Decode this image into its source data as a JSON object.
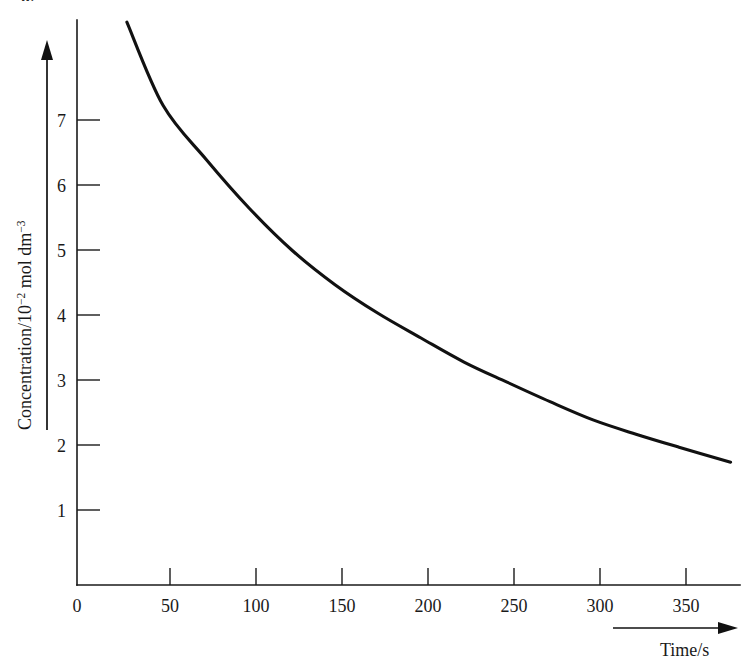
{
  "page": {
    "folio": "62"
  },
  "figure": {
    "name": "concentration-time-decay-plot"
  },
  "chart_data": {
    "type": "line",
    "title": "",
    "subtitle": "",
    "xlabel": "Time/s",
    "ylabel_text": "Concentration/10",
    "ylabel_sup1": "−2",
    "ylabel_mid": " mol dm",
    "ylabel_sup2": "−3",
    "ylabel_full": "Concentration/10−2 mol dm−3",
    "xlim": [
      0,
      390
    ],
    "ylim": [
      0,
      8.7
    ],
    "xticks": [
      0,
      50,
      100,
      150,
      200,
      250,
      300,
      350
    ],
    "xticklabels": [
      "0",
      "50",
      "100",
      "150",
      "200",
      "250",
      "300",
      "350"
    ],
    "yticks": [
      1,
      2,
      3,
      4,
      5,
      6,
      7
    ],
    "yticklabels": [
      "1",
      "2",
      "3",
      "4",
      "5",
      "6",
      "7"
    ],
    "grid": false,
    "legend": null,
    "legend_position": "none",
    "axis_arrows": {
      "x_arrow": true,
      "y_arrow": true
    },
    "series": [
      {
        "name": "Concentration",
        "x": [
          29,
          50,
          75,
          100,
          125,
          150,
          175,
          200,
          225,
          250,
          275,
          300,
          325,
          350,
          380
        ],
        "values": [
          8.66,
          7.38,
          6.55,
          5.8,
          5.15,
          4.62,
          4.18,
          3.8,
          3.43,
          3.12,
          2.82,
          2.54,
          2.32,
          2.12,
          1.89
        ]
      }
    ],
    "annotations": []
  }
}
